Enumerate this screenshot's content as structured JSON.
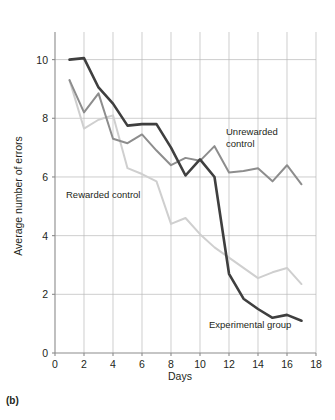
{
  "figure": {
    "panel_label": "(b)",
    "xlabel": "Days",
    "ylabel": "Average number of errors"
  },
  "annotations": {
    "unrewarded_line1": "Unrewarded",
    "unrewarded_line2": "control",
    "rewarded": "Rewarded control",
    "experimental": "Experimental group"
  },
  "chart_data": {
    "type": "line",
    "title": "",
    "xlabel": "Days",
    "ylabel": "Average number of errors",
    "xlim": [
      0,
      18
    ],
    "ylim": [
      0,
      10.6
    ],
    "xticks": [
      0,
      2,
      4,
      6,
      8,
      10,
      12,
      14,
      16,
      18
    ],
    "yticks": [
      0,
      2,
      4,
      6,
      8,
      10
    ],
    "grid": true,
    "legend_position": "inline-annotations",
    "colors": {
      "experimental_group": "#3f3f3f",
      "unrewarded_control": "#8d8d8d",
      "rewarded_control": "#cfcfcf",
      "gridline": "#b9b9b9",
      "axis": "#8b8b8b",
      "text": "#231f20",
      "background": "#ffffff"
    },
    "x": [
      1,
      2,
      3,
      4,
      5,
      6,
      7,
      8,
      9,
      10,
      11,
      12,
      13,
      14,
      15,
      16,
      17
    ],
    "series": [
      {
        "name": "Experimental group",
        "color": "#3f3f3f",
        "values": [
          10.0,
          10.05,
          9.05,
          8.5,
          7.75,
          7.8,
          7.8,
          7.0,
          6.05,
          6.6,
          6.0,
          2.7,
          1.85,
          1.5,
          1.2,
          1.3,
          1.1
        ]
      },
      {
        "name": "Unrewarded control",
        "color": "#8d8d8d",
        "values": [
          9.3,
          8.2,
          8.85,
          7.3,
          7.15,
          7.45,
          6.9,
          6.4,
          6.65,
          6.55,
          7.05,
          6.15,
          6.2,
          6.3,
          5.85,
          6.4,
          5.75
        ]
      },
      {
        "name": "Rewarded control",
        "color": "#cfcfcf",
        "values": [
          9.3,
          7.65,
          7.95,
          8.1,
          6.3,
          6.1,
          5.85,
          4.4,
          4.6,
          4.05,
          3.6,
          3.25,
          2.9,
          2.55,
          2.75,
          2.9,
          2.35
        ]
      }
    ]
  }
}
